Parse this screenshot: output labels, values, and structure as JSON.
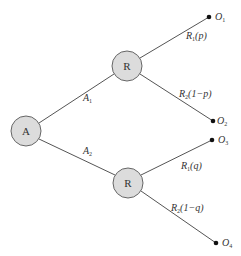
{
  "diagram": {
    "type": "decision-tree",
    "colors": {
      "edge": "#555555",
      "node_fill": "#dcdcdc",
      "node_stroke": "#666666",
      "text": "#333333",
      "terminal": "#111111"
    },
    "nodes": {
      "root": {
        "label": "A"
      },
      "r_top": {
        "label": "R"
      },
      "r_bottom": {
        "label": "R"
      }
    },
    "edges": {
      "a1": {
        "label_main": "A",
        "label_sub": "1"
      },
      "a2": {
        "label_main": "A",
        "label_sub": "2"
      },
      "r1p": {
        "label_main": "R",
        "label_sub": "1",
        "label_rest": "(p)"
      },
      "r2p": {
        "label_main": "R",
        "label_sub": "2",
        "label_rest": "(1−p)"
      },
      "r1q": {
        "label_main": "R",
        "label_sub": "1",
        "label_rest": "(q)"
      },
      "r2q": {
        "label_main": "R",
        "label_sub": "2",
        "label_rest": "(1−q)"
      }
    },
    "outcomes": [
      {
        "label_main": "O",
        "label_sub": "1"
      },
      {
        "label_main": "O",
        "label_sub": "2"
      },
      {
        "label_main": "O",
        "label_sub": "3"
      },
      {
        "label_main": "O",
        "label_sub": "4"
      }
    ]
  }
}
